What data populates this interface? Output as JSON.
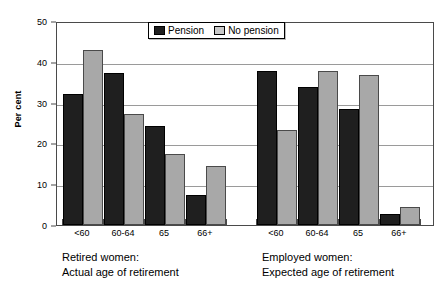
{
  "chart_data": {
    "type": "bar",
    "title": "",
    "xlabel": "",
    "ylabel": "Per cent",
    "ylim": [
      0,
      50
    ],
    "yticks": [
      0,
      10,
      20,
      30,
      40,
      50
    ],
    "grid": true,
    "legend_position": "top-center",
    "categories": [
      "<60",
      "60-64",
      "65",
      "66+"
    ],
    "panels": [
      {
        "caption_line1": "Retired  women:",
        "caption_line2": "Actual age of retirement",
        "categories": [
          "<60",
          "60-64",
          "65",
          "66+"
        ],
        "series": [
          {
            "name": "Pension",
            "values": [
              32.0,
              37.3,
              24.2,
              7.4
            ]
          },
          {
            "name": "No pension",
            "values": [
              43.0,
              27.1,
              17.3,
              14.4
            ]
          }
        ]
      },
      {
        "caption_line1": "Employed women:",
        "caption_line2": "Expected age of retirement",
        "categories": [
          "<60",
          "60-64",
          "65",
          "66+"
        ],
        "series": [
          {
            "name": "Pension",
            "values": [
              37.8,
              33.9,
              28.4,
              2.6
            ]
          },
          {
            "name": "No pension",
            "values": [
              23.4,
              37.8,
              36.8,
              4.3
            ]
          }
        ]
      }
    ],
    "legend": [
      {
        "label": "Pension",
        "color": "#1f1f1f"
      },
      {
        "label": "No pension",
        "color": "#c9c9c9"
      }
    ],
    "colors": {
      "pension": "#1f1f1f",
      "no_pension": "#a8a8a8",
      "axis": "#4a4a4a",
      "grid": "#9a9a9a",
      "background": "#ffffff"
    }
  }
}
